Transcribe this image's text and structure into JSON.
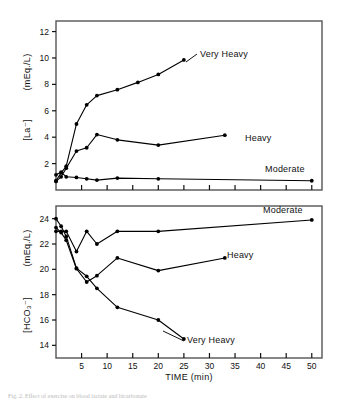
{
  "figure": {
    "xlabel": "TIME  (min)",
    "caption": "Fig. 2.  Effect of exercise on blood lactate and bicarbonate"
  },
  "chart_data": [
    {
      "type": "line",
      "panel": "top",
      "title": "",
      "xlabel": "TIME  (min)",
      "ylabel": "[La⁻]  (mEq./L)",
      "ylabel_bracket": "[La⁻]",
      "ylabel_units": "(mEq./L)",
      "xlim": [
        0,
        52
      ],
      "ylim": [
        0,
        12.8
      ],
      "xticks": [
        5,
        10,
        15,
        20,
        25,
        30,
        35,
        40,
        45,
        50
      ],
      "yticks": [
        2,
        4,
        6,
        8,
        10,
        12
      ],
      "grid": false,
      "legend_position": "inline-annotation",
      "series": [
        {
          "name": "Very Heavy",
          "label": "Very Heavy",
          "color": "#000000",
          "x": [
            0,
            1,
            2,
            4,
            6,
            8,
            12,
            16,
            20,
            25
          ],
          "y": [
            0.7,
            1.3,
            1.8,
            5.0,
            6.45,
            7.15,
            7.6,
            8.15,
            8.75,
            9.85
          ]
        },
        {
          "name": "Heavy",
          "label": "Heavy",
          "color": "#000000",
          "x": [
            0,
            1,
            2,
            4,
            6,
            8,
            12,
            20,
            33
          ],
          "y": [
            0.65,
            1.0,
            1.65,
            2.95,
            3.2,
            4.2,
            3.8,
            3.4,
            4.15
          ]
        },
        {
          "name": "Moderate",
          "label": "Moderate",
          "color": "#000000",
          "x": [
            0,
            1,
            2,
            4,
            6,
            8,
            12,
            20,
            50
          ],
          "y": [
            1.15,
            1.35,
            1.0,
            0.95,
            0.85,
            0.75,
            0.9,
            0.85,
            0.7
          ]
        }
      ]
    },
    {
      "type": "line",
      "panel": "bottom",
      "title": "",
      "xlabel": "TIME  (min)",
      "ylabel": "[HCO₃⁻]  (mEq./L)",
      "ylabel_bracket": "[HCO₃⁻]",
      "ylabel_units": "(mEq./L)",
      "xlim": [
        0,
        52
      ],
      "ylim": [
        13.0,
        25.0
      ],
      "xticks": [
        5,
        10,
        15,
        20,
        25,
        30,
        35,
        40,
        45,
        50
      ],
      "yticks": [
        14,
        16,
        18,
        20,
        22,
        24
      ],
      "grid": false,
      "legend_position": "inline-annotation",
      "series": [
        {
          "name": "Moderate",
          "label": "Moderate",
          "color": "#000000",
          "x": [
            0,
            1,
            2,
            4,
            6,
            8,
            12,
            20,
            50
          ],
          "y": [
            23.0,
            23.0,
            23.0,
            21.4,
            23.0,
            22.0,
            23.0,
            23.0,
            23.9
          ]
        },
        {
          "name": "Heavy",
          "label": "Heavy",
          "color": "#000000",
          "x": [
            0,
            1,
            2,
            4,
            6,
            8,
            12,
            20,
            33
          ],
          "y": [
            23.3,
            22.9,
            22.3,
            20.05,
            19.0,
            19.5,
            20.9,
            19.9,
            20.9
          ]
        },
        {
          "name": "Very Heavy",
          "label": "Very Heavy",
          "color": "#000000",
          "x": [
            0,
            1,
            2,
            4,
            6,
            8,
            12,
            20,
            25
          ],
          "y": [
            24.0,
            23.4,
            22.6,
            20.1,
            19.45,
            18.5,
            17.0,
            16.0,
            14.5
          ]
        }
      ]
    }
  ]
}
